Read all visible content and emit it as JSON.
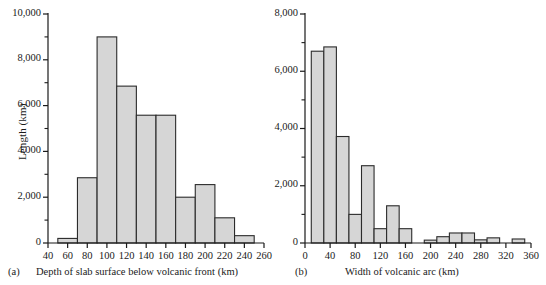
{
  "figure": {
    "background": "#ffffff",
    "bar_fill": "#d6d6d6",
    "bar_stroke": "#2b2b2b",
    "axis_color": "#1a1a1a"
  },
  "panels": [
    {
      "letter": "(a)",
      "xlabel": "Depth of slab surface below volcanic front (km)",
      "ylabel": "Length (km)"
    },
    {
      "letter": "(b)",
      "xlabel": "Width of volcanic arc (km)",
      "ylabel": ""
    }
  ],
  "chart_data": [
    {
      "type": "bar",
      "title": "",
      "panel": "(a)",
      "xlabel": "Depth of slab surface below volcanic front (km)",
      "ylabel": "Length (km)",
      "xlim": [
        40,
        260
      ],
      "ylim": [
        0,
        10000
      ],
      "xticks": [
        40,
        60,
        80,
        100,
        120,
        140,
        160,
        180,
        200,
        220,
        240,
        260
      ],
      "xtick_labels": [
        "40",
        "60",
        "80",
        "100",
        "120",
        "140",
        "160",
        "180",
        "200",
        "220",
        "240",
        "260"
      ],
      "yticks": [
        0,
        2000,
        4000,
        6000,
        8000,
        10000
      ],
      "ytick_labels": [
        "0",
        "2,000",
        "4,000",
        "6,000",
        "8,000",
        "10,000"
      ],
      "minor_yticks": [
        1000,
        3000,
        5000,
        7000,
        9000
      ],
      "grid": false,
      "legend": "none",
      "bin_width": 20,
      "bin_edges": [
        50,
        70,
        90,
        110,
        130,
        150,
        170,
        190,
        210,
        230,
        250
      ],
      "categories": [
        "50-70",
        "70-90",
        "90-110",
        "110-130",
        "130-150",
        "150-170",
        "170-190",
        "190-210",
        "210-230",
        "230-250"
      ],
      "values": [
        200,
        2850,
        9000,
        6850,
        5580,
        5580,
        2000,
        2550,
        1100,
        320
      ]
    },
    {
      "type": "bar",
      "title": "",
      "panel": "(b)",
      "xlabel": "Width of volcanic arc (km)",
      "ylabel": "",
      "xlim": [
        0,
        360
      ],
      "ylim": [
        0,
        8000
      ],
      "xticks": [
        0,
        40,
        80,
        120,
        160,
        200,
        240,
        280,
        320,
        360
      ],
      "xtick_labels": [
        "0",
        "40",
        "80",
        "120",
        "160",
        "200",
        "240",
        "280",
        "320",
        "360"
      ],
      "yticks": [
        0,
        2000,
        4000,
        6000,
        8000
      ],
      "ytick_labels": [
        "0",
        "2,000",
        "4,000",
        "6,000",
        "8,000"
      ],
      "minor_yticks": [
        1000,
        3000,
        5000,
        7000
      ],
      "grid": false,
      "legend": "none",
      "bin_width": 20,
      "bin_edges": [
        10,
        30,
        50,
        70,
        90,
        110,
        130,
        150,
        170,
        190,
        210,
        230,
        250,
        270,
        290,
        310,
        330,
        350
      ],
      "categories": [
        "10-30",
        "30-50",
        "50-70",
        "70-90",
        "90-110",
        "110-130",
        "130-150",
        "150-170",
        "170-190",
        "190-210",
        "210-230",
        "230-250",
        "250-270",
        "270-290",
        "290-310",
        "310-330",
        "330-350"
      ],
      "values": [
        6700,
        6850,
        3720,
        1000,
        2700,
        500,
        1300,
        500,
        0,
        100,
        220,
        350,
        350,
        110,
        180,
        0,
        140
      ]
    }
  ]
}
